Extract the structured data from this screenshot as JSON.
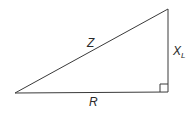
{
  "diagram": {
    "type": "impedance-triangle",
    "colors": {
      "line": "#3a3a3a",
      "text": "#2a2a2a",
      "background": "#ffffff"
    },
    "labels": {
      "hypotenuse": "Z",
      "vertical_main": "X",
      "vertical_sub": "L",
      "base": "R"
    },
    "vertices": {
      "bottom_left": [
        15,
        93
      ],
      "bottom_right": [
        168,
        92
      ],
      "top_right": [
        168,
        9
      ]
    },
    "right_angle_marker": "bottom-right"
  }
}
